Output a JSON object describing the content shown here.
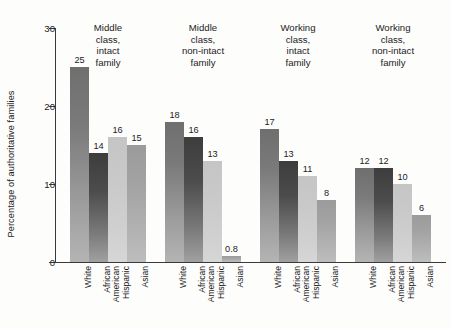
{
  "chart_data": {
    "type": "bar",
    "title": "",
    "subtitle": "",
    "xlabel": "",
    "ylabel": "Percentage of authoritative families",
    "ylim": [
      0,
      30
    ],
    "yticks": [
      0,
      10,
      20,
      30
    ],
    "ytick_labels": [
      "0",
      "10",
      "20",
      "30"
    ],
    "grid": false,
    "legend": "none",
    "categories": [
      "White",
      "African\nAmerican",
      "Hispanic",
      "Asian"
    ],
    "groups": [
      {
        "label": "Middle\nclass,\nintact\nfamily",
        "label_lines": [
          "Middle",
          "class,",
          "intact",
          "family"
        ],
        "values": [
          25,
          14,
          16,
          15
        ],
        "value_labels": [
          "25",
          "14",
          "16",
          "15"
        ]
      },
      {
        "label": "Middle\nclass,\nnon-intact\nfamily",
        "label_lines": [
          "Middle",
          "class,",
          "non-intact",
          "family"
        ],
        "values": [
          18,
          16,
          13,
          0.8
        ],
        "value_labels": [
          "18",
          "16",
          "13",
          "0.8"
        ]
      },
      {
        "label": "Working\nclass,\nintact\nfamily",
        "label_lines": [
          "Working",
          "class,",
          "intact",
          "family"
        ],
        "values": [
          17,
          13,
          11,
          8
        ],
        "value_labels": [
          "17",
          "13",
          "11",
          "8"
        ]
      },
      {
        "label": "Working\nclass,\nnon-intact\nfamily",
        "label_lines": [
          "Working",
          "class,",
          "non-intact",
          "family"
        ],
        "values": [
          12,
          12,
          10,
          6
        ],
        "value_labels": [
          "12",
          "12",
          "10",
          "6"
        ]
      }
    ],
    "series_colors": [
      "#7a7a7a",
      "#434343",
      "#c8c8c8",
      "#a2a2a2"
    ],
    "axis_color": "#3a3a3a",
    "background_color": "#fdfdfc",
    "text_color": "#1c1c1c"
  }
}
